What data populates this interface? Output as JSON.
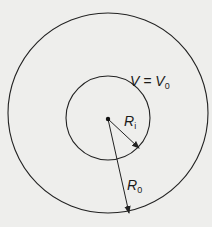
{
  "figure": {
    "type": "concentric-circles",
    "outer_circle": {
      "cx": 108,
      "cy": 113,
      "r": 100
    },
    "inner_circle": {
      "cx": 108,
      "cy": 118,
      "r": 42
    },
    "center_point": {
      "x": 108,
      "y": 119
    },
    "labels": {
      "potential": {
        "main": "V = V",
        "sub": "0"
      },
      "inner_radius": {
        "main": "R",
        "sub": "i"
      },
      "outer_radius": {
        "main": "R",
        "sub": "0"
      }
    },
    "arrows": {
      "inner_radius": {
        "from": [
          108,
          119
        ],
        "to": [
          139,
          148
        ]
      },
      "outer_radius": {
        "from": [
          108,
          119
        ],
        "to": [
          129,
          213
        ]
      }
    },
    "colors": {
      "stroke": "#222222",
      "background": "#eeeeec"
    }
  }
}
